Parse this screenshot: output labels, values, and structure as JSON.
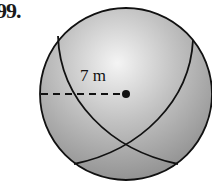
{
  "problem": {
    "number": "99.",
    "radius_label": "7 m"
  },
  "figure": {
    "shape": "sphere",
    "center": [
      126,
      94
    ],
    "radius_px": 86,
    "colors": {
      "highlight": "#f4f4f4",
      "shade": "#8a8a8a",
      "outline": "#111111"
    }
  }
}
